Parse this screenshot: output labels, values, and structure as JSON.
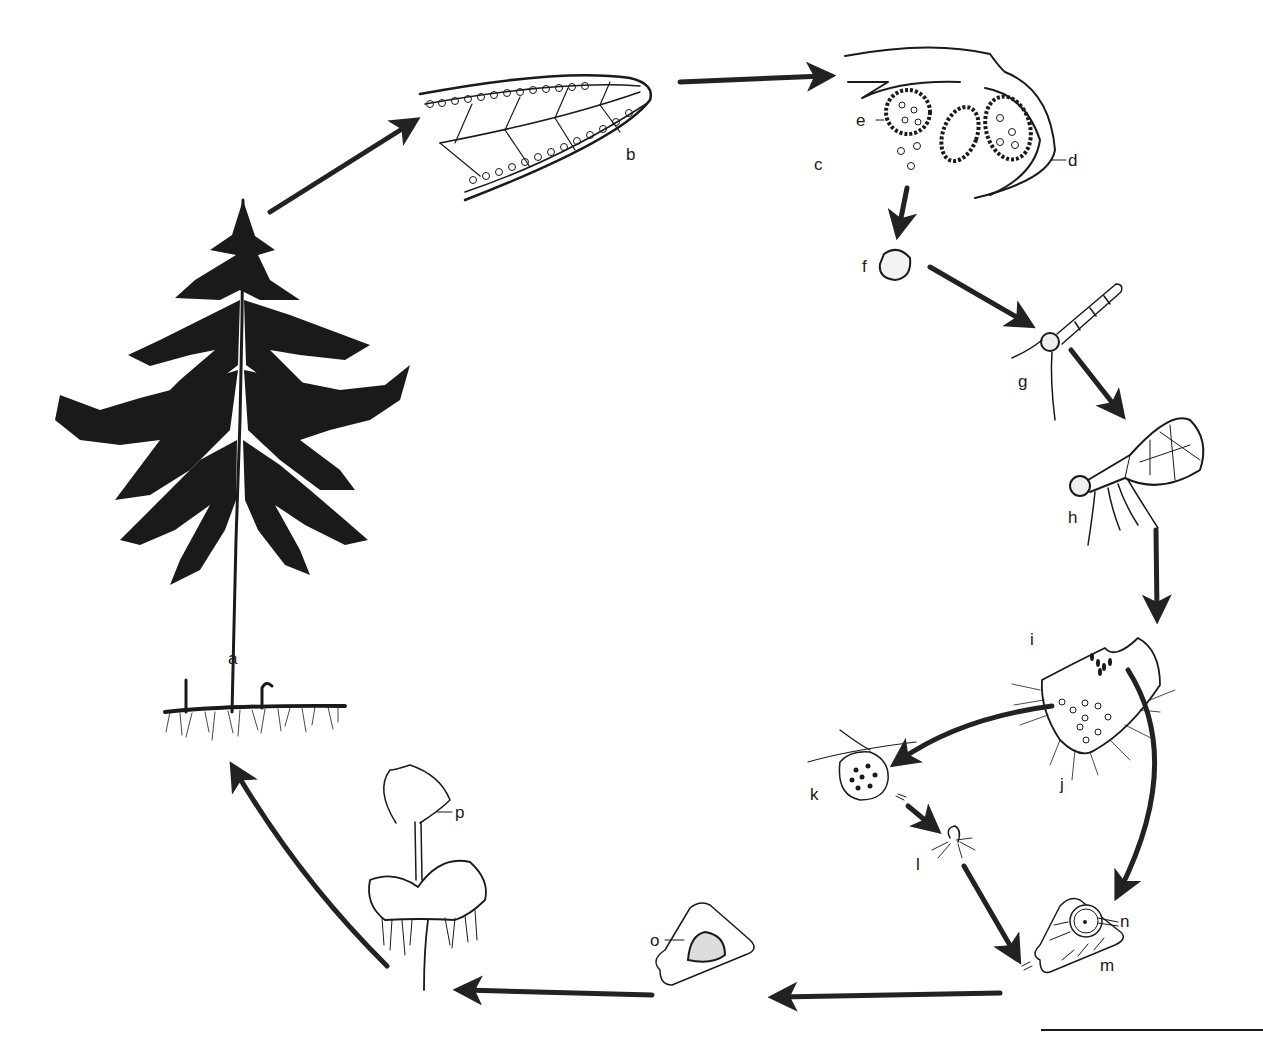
{
  "diagram": {
    "type": "life-cycle",
    "colors": {
      "ink": "#1a1a1a",
      "background": "#ffffff"
    },
    "stages": [
      {
        "id": "a",
        "label": "a",
        "depicts": "mature sporophyte fern with rhizome and roots"
      },
      {
        "id": "b",
        "label": "b",
        "depicts": "pinnule with sori along margins"
      },
      {
        "id": "c",
        "label": "c",
        "depicts": "section through sorus"
      },
      {
        "id": "d",
        "label": "d",
        "depicts": "indusium (leaf margin flap)"
      },
      {
        "id": "e",
        "label": "e",
        "depicts": "sporangium releasing spores"
      },
      {
        "id": "f",
        "label": "f",
        "depicts": "spore"
      },
      {
        "id": "g",
        "label": "g",
        "depicts": "germinating spore with filament and rhizoids"
      },
      {
        "id": "h",
        "label": "h",
        "depicts": "young prothallus"
      },
      {
        "id": "i",
        "label": "i",
        "depicts": "mature heart-shaped prothallus (archegonia region)"
      },
      {
        "id": "j",
        "label": "j",
        "depicts": "antheridia region with rhizoids"
      },
      {
        "id": "k",
        "label": "k",
        "depicts": "antheridium releasing sperm"
      },
      {
        "id": "l",
        "label": "l",
        "depicts": "spermatozoid"
      },
      {
        "id": "m",
        "label": "m",
        "depicts": "archegonium"
      },
      {
        "id": "n",
        "label": "n",
        "depicts": "egg cell"
      },
      {
        "id": "o",
        "label": "o",
        "depicts": "fertilized egg / embryo in archegonium"
      },
      {
        "id": "p",
        "label": "p",
        "depicts": "young sporophyte growing from prothallus"
      }
    ],
    "flow": [
      [
        "a",
        "b"
      ],
      [
        "b",
        "c"
      ],
      [
        "c",
        "f"
      ],
      [
        "f",
        "g"
      ],
      [
        "g",
        "h"
      ],
      [
        "h",
        "i"
      ],
      [
        "j",
        "k"
      ],
      [
        "k",
        "l"
      ],
      [
        "l",
        "m"
      ],
      [
        "i",
        "n"
      ],
      [
        "m",
        "o"
      ],
      [
        "o",
        "p"
      ],
      [
        "p",
        "a"
      ]
    ],
    "scale_bar": true
  }
}
